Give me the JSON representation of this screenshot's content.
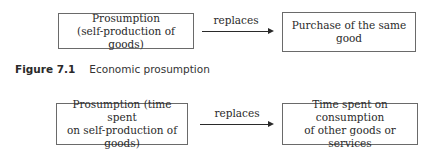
{
  "figure_7_1": {
    "left_box": {
      "line1": "Prosumption",
      "line2": "(self-production of goods)"
    },
    "arrow_label": "replaces",
    "right_box": {
      "line1": "Purchase of the same good"
    },
    "caption": {
      "number": "Figure 7.1",
      "title": "Economic prosumption"
    }
  },
  "figure_7_2": {
    "left_box": {
      "line1": "Prosumption (time spent",
      "line2": "on self-production of goods)"
    },
    "arrow_label": "replaces",
    "right_box": {
      "line1": "Time spent on consumption",
      "line2": "of other goods or services"
    }
  }
}
